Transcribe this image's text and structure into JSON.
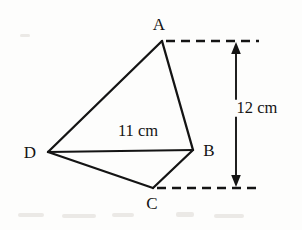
{
  "figure": {
    "background_color": "#fdfdfc",
    "stroke_color": "#141414",
    "vertices": [
      {
        "name": "A",
        "label": "A",
        "x": 162,
        "y": 41,
        "label_x": 159,
        "label_y": 24
      },
      {
        "name": "B",
        "label": "B",
        "x": 193,
        "y": 150,
        "label_x": 209,
        "label_y": 150
      },
      {
        "name": "C",
        "label": "C",
        "x": 153,
        "y": 188,
        "label_x": 152,
        "label_y": 203
      },
      {
        "name": "D",
        "label": "D",
        "x": 48,
        "y": 152,
        "label_x": 30,
        "label_y": 152
      }
    ],
    "edges": [
      {
        "name": "edge-DA",
        "from": "D",
        "to": "A",
        "x1": 48,
        "y1": 152,
        "x2": 162,
        "y2": 41
      },
      {
        "name": "edge-AB",
        "from": "A",
        "to": "B",
        "x1": 162,
        "y1": 41,
        "x2": 193,
        "y2": 150
      },
      {
        "name": "edge-BC",
        "from": "B",
        "to": "C",
        "x1": 193,
        "y1": 150,
        "x2": 153,
        "y2": 188
      },
      {
        "name": "edge-CD",
        "from": "C",
        "to": "D",
        "x1": 153,
        "y1": 188,
        "x2": 48,
        "y2": 152
      },
      {
        "name": "diagonal-DB",
        "from": "D",
        "to": "B",
        "x1": 48,
        "y1": 152,
        "x2": 193,
        "y2": 150
      }
    ],
    "measurements": [
      {
        "name": "diagonal-length",
        "text": "11 cm",
        "value": 11,
        "unit": "cm",
        "applies_to": "DB",
        "label_x": 138,
        "label_y": 131
      },
      {
        "name": "height-dimension",
        "text": "12 cm",
        "value": 12,
        "unit": "cm",
        "applies_to": "vertical distance from A to C",
        "label_x": 257,
        "label_y": 108
      }
    ],
    "extension_lines": [
      {
        "name": "extension-line-top",
        "x1": 166,
        "y1": 41,
        "x2": 259,
        "y2": 41
      },
      {
        "name": "extension-line-bottom",
        "x1": 157,
        "y1": 188,
        "x2": 259,
        "y2": 188
      }
    ],
    "dimension_arrow": {
      "name": "height-arrow",
      "x": 236,
      "y_top": 43,
      "y_bottom": 186,
      "double_headed": true
    }
  }
}
